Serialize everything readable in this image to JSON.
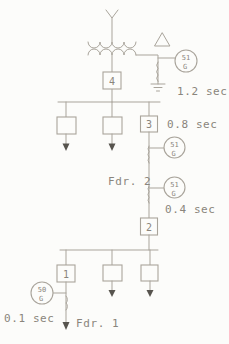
{
  "diagram_type": "power-system-one-line-relay-coordination",
  "colors": {
    "line": "#a9a49b",
    "text": "#8a857c",
    "arrowhead": "#57544e",
    "background": "#fcfcfa"
  },
  "icons": {
    "source_winding": "wye-icon",
    "tertiary_winding": "delta-icon",
    "neutral_ground": "ground-icon",
    "load": "down-arrow-icon",
    "ct_coil": "coil-icon"
  },
  "breakers": {
    "b1": "1",
    "b2": "2",
    "b3": "3",
    "b4": "4"
  },
  "relays": {
    "xfmr_neutral": {
      "device": "51",
      "ground": "G",
      "time": "1.2 sec"
    },
    "fdr2_upper": {
      "device": "51",
      "ground": "G",
      "time": "0.8 sec"
    },
    "fdr2_lower": {
      "device": "51",
      "ground": "G",
      "time": "0.4 sec"
    },
    "fdr1": {
      "device": "50",
      "ground": "G",
      "time": "0.1 sec"
    }
  },
  "feeders": {
    "fdr1": "Fdr. 1",
    "fdr2": "Fdr. 2"
  }
}
